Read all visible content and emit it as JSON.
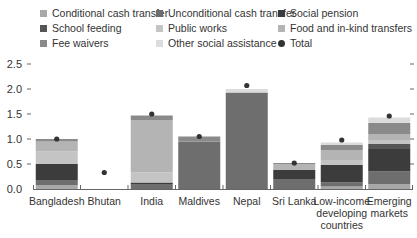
{
  "chart_data": {
    "type": "bar",
    "stacked": true,
    "title": "",
    "xlabel": "",
    "ylabel": "",
    "ylim": [
      0,
      2.5
    ],
    "yticks": [
      "0.0",
      "0.5",
      "1.0",
      "1.5",
      "2.0",
      "2.5"
    ],
    "grid": false,
    "legend_position": "top",
    "categories": [
      "Bangladesh",
      "Bhutan",
      "India",
      "Maldives",
      "Nepal",
      "Sri Lanka",
      "Low-income developing countries",
      "Emerging markets"
    ],
    "category_lines": [
      [
        "Bangladesh"
      ],
      [
        "Bhutan"
      ],
      [
        "India"
      ],
      [
        "Maldives"
      ],
      [
        "Nepal"
      ],
      [
        "Sri Lanka"
      ],
      [
        "Low-income",
        "developing",
        "countries"
      ],
      [
        "Emerging",
        "markets"
      ]
    ],
    "series": [
      {
        "name": "Conditional cash transfer",
        "color": "#a8a8a8",
        "values": [
          0.08,
          0.0,
          0.0,
          0.0,
          0.0,
          0.0,
          0.05,
          0.1
        ]
      },
      {
        "name": "Unconditional cash transfer",
        "color": "#6e6e6e",
        "values": [
          0.1,
          0.0,
          0.1,
          0.95,
          1.93,
          0.2,
          0.08,
          0.25
        ]
      },
      {
        "name": "Social pension",
        "color": "#3c3c3c",
        "values": [
          0.32,
          0.0,
          0.03,
          0.0,
          0.0,
          0.18,
          0.35,
          0.45
        ]
      },
      {
        "name": "School feeding",
        "color": "#555555",
        "values": [
          0.0,
          0.0,
          0.0,
          0.0,
          0.0,
          0.0,
          0.0,
          0.1
        ]
      },
      {
        "name": "Public works",
        "color": "#c4c4c4",
        "values": [
          0.25,
          0.0,
          0.2,
          0.0,
          0.0,
          0.0,
          0.1,
          0.08
        ]
      },
      {
        "name": "Food and in-kind transfers",
        "color": "#b4b4b4",
        "values": [
          0.2,
          0.0,
          1.05,
          0.0,
          0.0,
          0.12,
          0.2,
          0.12
        ]
      },
      {
        "name": "Fee waivers",
        "color": "#8a8a8a",
        "values": [
          0.05,
          0.0,
          0.09,
          0.1,
          0.0,
          0.02,
          0.1,
          0.22
        ]
      },
      {
        "name": "Other social assistance",
        "color": "#dcdcdc",
        "values": [
          0.0,
          0.0,
          0.0,
          0.0,
          0.07,
          0.0,
          0.05,
          0.11
        ]
      }
    ],
    "totals": {
      "name": "Total",
      "marker": "dot",
      "values": [
        1.0,
        0.33,
        1.5,
        1.05,
        2.07,
        0.52,
        0.98,
        1.46
      ]
    }
  },
  "legend": {
    "items": [
      {
        "label": "Conditional cash transfer",
        "color": "#a8a8a8",
        "shape": "square"
      },
      {
        "label": "Unconditional cash transfer",
        "color": "#6e6e6e",
        "shape": "square"
      },
      {
        "label": "Social pension",
        "color": "#3c3c3c",
        "shape": "square"
      },
      {
        "label": "School feeding",
        "color": "#555555",
        "shape": "square"
      },
      {
        "label": "Public works",
        "color": "#c4c4c4",
        "shape": "square"
      },
      {
        "label": "Food and in-kind transfers",
        "color": "#b4b4b4",
        "shape": "square"
      },
      {
        "label": "Fee waivers",
        "color": "#8a8a8a",
        "shape": "square"
      },
      {
        "label": "Other social assistance",
        "color": "#dcdcdc",
        "shape": "square"
      },
      {
        "label": "Total",
        "color": "#333333",
        "shape": "dot"
      }
    ]
  }
}
